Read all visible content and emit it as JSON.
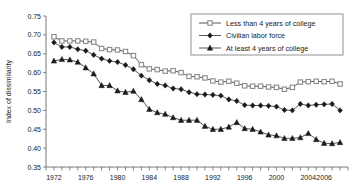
{
  "chart_data": {
    "type": "line",
    "title": "",
    "xlabel": "",
    "ylabel": "Index of dissimilarity",
    "xlim": [
      1971,
      2009
    ],
    "ylim": [
      0.35,
      0.75
    ],
    "ytick_step": 0.05,
    "yticks": [
      "0.75",
      "0.70",
      "0.65",
      "0.60",
      "0.55",
      "0.50",
      "0.45",
      "0.40",
      "0.35"
    ],
    "ytick_values": [
      0.75,
      0.7,
      0.65,
      0.6,
      0.55,
      0.5,
      0.45,
      0.4,
      0.35
    ],
    "xticks": [
      "1972",
      "1976",
      "1980",
      "1984",
      "1988",
      "1992",
      "1996",
      "2000",
      "2004",
      "2006"
    ],
    "xtick_values": [
      1972,
      1976,
      1980,
      1984,
      1988,
      1992,
      1996,
      2000,
      2004,
      2006
    ],
    "xtick_minor_step": 1,
    "grid": false,
    "legend_position": "top-right",
    "x": [
      1972,
      1973,
      1974,
      1975,
      1976,
      1977,
      1978,
      1979,
      1980,
      1981,
      1982,
      1983,
      1984,
      1985,
      1986,
      1987,
      1988,
      1989,
      1990,
      1991,
      1992,
      1993,
      1994,
      1995,
      1996,
      1997,
      1998,
      1999,
      2000,
      2001,
      2002,
      2003,
      2004,
      2005,
      2006,
      2007,
      2008
    ],
    "series": [
      {
        "name": "Less than 4 years of college",
        "marker": "square-open",
        "color": "#8a8a8a",
        "values": [
          0.695,
          0.684,
          0.684,
          0.684,
          0.683,
          0.681,
          0.664,
          0.661,
          0.66,
          0.656,
          0.645,
          0.621,
          0.61,
          0.608,
          0.604,
          0.605,
          0.6,
          0.59,
          0.589,
          0.586,
          0.578,
          0.575,
          0.577,
          0.572,
          0.565,
          0.564,
          0.564,
          0.562,
          0.561,
          0.556,
          0.561,
          0.575,
          0.576,
          0.577,
          0.576,
          0.577,
          0.57
        ]
      },
      {
        "name": "Civilian labor force",
        "marker": "diamond-filled",
        "color": "#1a1a1a",
        "values": [
          0.68,
          0.668,
          0.668,
          0.662,
          0.658,
          0.647,
          0.637,
          0.631,
          0.628,
          0.62,
          0.609,
          0.592,
          0.58,
          0.57,
          0.566,
          0.558,
          0.556,
          0.548,
          0.543,
          0.542,
          0.541,
          0.539,
          0.529,
          0.525,
          0.514,
          0.513,
          0.513,
          0.512,
          0.51,
          0.501,
          0.5,
          0.517,
          0.513,
          0.515,
          0.516,
          0.517,
          0.5
        ]
      },
      {
        "name": "At least 4 years of college",
        "marker": "triangle-filled",
        "color": "#1a1a1a",
        "values": [
          0.631,
          0.635,
          0.634,
          0.628,
          0.613,
          0.597,
          0.566,
          0.566,
          0.552,
          0.548,
          0.551,
          0.529,
          0.503,
          0.494,
          0.49,
          0.481,
          0.474,
          0.474,
          0.474,
          0.458,
          0.45,
          0.45,
          0.456,
          0.468,
          0.452,
          0.45,
          0.443,
          0.435,
          0.433,
          0.426,
          0.426,
          0.428,
          0.439,
          0.423,
          0.413,
          0.412,
          0.415
        ]
      }
    ],
    "series2_extra": [
      0.414,
      0.417,
      0.421,
      0.419,
      0.405,
      0.415,
      0.421,
      0.419,
      0.427,
      0.41,
      0.398
    ]
  },
  "legend": {
    "entries": [
      {
        "label": "Less than 4 years of college"
      },
      {
        "label": "Civilian labor force"
      },
      {
        "label": "At least 4 years of college"
      }
    ]
  }
}
